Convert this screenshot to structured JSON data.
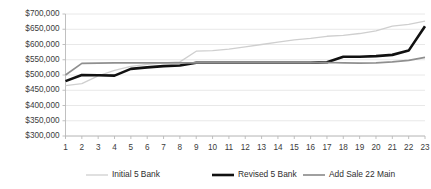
{
  "chart_data": {
    "type": "line",
    "title": "",
    "subtitle": "",
    "xlabel": "",
    "ylabel": "",
    "x": [
      1,
      2,
      3,
      4,
      5,
      6,
      7,
      8,
      9,
      10,
      11,
      12,
      13,
      14,
      15,
      16,
      17,
      18,
      19,
      20,
      21,
      22,
      23
    ],
    "x_tick_labels": [
      "1",
      "2",
      "3",
      "4",
      "5",
      "6",
      "7",
      "8",
      "9",
      "10",
      "11",
      "12",
      "13",
      "14",
      "15",
      "16",
      "17",
      "18",
      "19",
      "20",
      "21",
      "22",
      "23"
    ],
    "y_tick_labels": [
      "$700,000",
      "$650,000",
      "$600,000",
      "$550,000",
      "$500,000",
      "$450,000",
      "$400,000",
      "$350,000",
      "$300,000"
    ],
    "y_tick_values": [
      700000,
      650000,
      600000,
      550000,
      500000,
      450000,
      400000,
      350000,
      300000
    ],
    "ylim": [
      300000,
      700000
    ],
    "xlim": [
      1,
      23
    ],
    "grid": true,
    "grid_axis": "y",
    "legend_position": "bottom",
    "series": [
      {
        "name": "Initial  5 Bank",
        "color": "#cfcfcf",
        "width": 1.3,
        "values": [
          465000,
          472000,
          497000,
          515000,
          528000,
          535000,
          540000,
          543000,
          578000,
          580000,
          585000,
          592000,
          600000,
          608000,
          615000,
          620000,
          627000,
          630000,
          636000,
          645000,
          660000,
          666000,
          677000
        ]
      },
      {
        "name": "Revised 5 Bank",
        "color": "#111111",
        "width": 2.6,
        "values": [
          480000,
          500000,
          499000,
          498000,
          520000,
          525000,
          529000,
          531000,
          540000,
          540000,
          540000,
          540000,
          540000,
          540000,
          540000,
          540000,
          542000,
          560000,
          560000,
          562000,
          566000,
          580000,
          660000
        ]
      },
      {
        "name": "Add Sale 22 Main",
        "color": "#8f8f8f",
        "width": 1.7,
        "values": [
          500000,
          538000,
          539000,
          540000,
          540000,
          540000,
          540000,
          540000,
          540000,
          540000,
          540000,
          540000,
          540000,
          540000,
          540000,
          540000,
          541000,
          540000,
          539000,
          540000,
          543000,
          548000,
          558000
        ]
      }
    ]
  },
  "legend": {
    "items": [
      {
        "label": "Initial  5 Bank"
      },
      {
        "label": "Revised 5 Bank"
      },
      {
        "label": "Add Sale 22 Main"
      }
    ]
  },
  "colors": {
    "background": "#ffffff",
    "gridline": "#e2e2e2",
    "axis": "#b9b9b9",
    "text": "#3b3b3b",
    "series_initial": "#cfcfcf",
    "series_revised": "#111111",
    "series_addsale": "#8f8f8f"
  }
}
